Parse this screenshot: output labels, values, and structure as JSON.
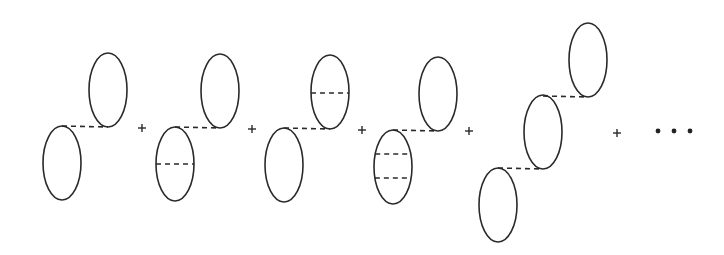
{
  "diagram": {
    "colors": {
      "stroke": "#2a2a2a",
      "background": "#ffffff"
    },
    "ellipse_rx": 19,
    "ellipse_ry": 37,
    "terms": [
      {
        "id": "term-1",
        "loops": [
          {
            "cx": 108,
            "cy": 90,
            "internal_lines": []
          },
          {
            "cx": 62,
            "cy": 163,
            "internal_lines": []
          }
        ],
        "connectors": [
          {
            "x1": 62,
            "y1": 126,
            "x2": 108,
            "y2": 127
          }
        ]
      },
      {
        "id": "term-2",
        "loops": [
          {
            "cx": 220,
            "cy": 91,
            "internal_lines": []
          },
          {
            "cx": 175,
            "cy": 164,
            "internal_lines": [
              164
            ]
          }
        ],
        "connectors": [
          {
            "x1": 175,
            "y1": 127,
            "x2": 220,
            "y2": 128
          }
        ]
      },
      {
        "id": "term-3",
        "loops": [
          {
            "cx": 330,
            "cy": 92,
            "internal_lines": [
              93
            ]
          },
          {
            "cx": 284,
            "cy": 165,
            "internal_lines": []
          }
        ],
        "connectors": [
          {
            "x1": 284,
            "y1": 128,
            "x2": 330,
            "y2": 129
          }
        ]
      },
      {
        "id": "term-4",
        "loops": [
          {
            "cx": 438,
            "cy": 94,
            "internal_lines": []
          },
          {
            "cx": 393,
            "cy": 167,
            "internal_lines": [
              154,
              178
            ]
          }
        ],
        "connectors": [
          {
            "x1": 393,
            "y1": 130,
            "x2": 438,
            "y2": 131
          }
        ]
      },
      {
        "id": "term-5",
        "loops": [
          {
            "cx": 588,
            "cy": 60,
            "internal_lines": []
          },
          {
            "cx": 543,
            "cy": 132,
            "internal_lines": []
          },
          {
            "cx": 498,
            "cy": 205,
            "internal_lines": []
          }
        ],
        "connectors": [
          {
            "x1": 543,
            "y1": 96,
            "x2": 588,
            "y2": 97
          },
          {
            "x1": 498,
            "y1": 168,
            "x2": 543,
            "y2": 169
          }
        ]
      }
    ],
    "operators": [
      {
        "symbol": "+",
        "x": 142,
        "y": 128
      },
      {
        "symbol": "+",
        "x": 252,
        "y": 129
      },
      {
        "symbol": "+",
        "x": 362,
        "y": 130
      },
      {
        "symbol": "+",
        "x": 469,
        "y": 131
      },
      {
        "symbol": "+",
        "x": 617,
        "y": 133
      }
    ],
    "ellipsis": {
      "symbol": "...",
      "dots_x": [
        658,
        674,
        690
      ],
      "y": 131
    }
  }
}
